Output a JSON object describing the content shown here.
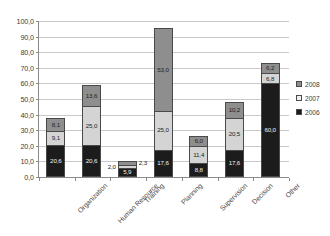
{
  "chart_data": {
    "type": "bar",
    "stacked": true,
    "title": "",
    "subtitle": "",
    "xlabel": "",
    "ylabel": "",
    "ylim": [
      0,
      100
    ],
    "ytick_step": 10,
    "grid": true,
    "legend_position": "right",
    "categories": [
      "Organization",
      "Human Resource",
      "Training",
      "Planning",
      "Supervision",
      "Decision",
      "Other"
    ],
    "ytick_labels": [
      "100,0",
      "90,0",
      "80,0",
      "70,0",
      "60,0",
      "50,0",
      "40,0",
      "30,0",
      "20,0",
      "10,0",
      "0,0"
    ],
    "ytick_values": [
      100,
      90,
      80,
      70,
      60,
      50,
      40,
      30,
      20,
      10,
      0
    ],
    "series": [
      {
        "name": "2006",
        "color": "#1c1c1c",
        "values": [
          20.6,
          20.6,
          5.9,
          17.6,
          8.8,
          17.6,
          60.0
        ],
        "labels": [
          "20,6",
          "20,6",
          "5,9",
          "17,6",
          "8,8",
          "17,6",
          "60,0"
        ]
      },
      {
        "name": "2007",
        "color": "#d4d4d4",
        "values": [
          9.1,
          25.0,
          2.0,
          25.0,
          11.4,
          20.5,
          6.8
        ],
        "labels": [
          "9,1",
          "25,0",
          "2,0",
          "25,0",
          "11,4",
          "20,5",
          "6,8"
        ]
      },
      {
        "name": "2008",
        "color": "#8e8e8e",
        "values": [
          8.1,
          13.6,
          2.3,
          53.0,
          6.0,
          10.2,
          6.2
        ],
        "labels": [
          "8,1",
          "13,6",
          "2,3",
          "53,0",
          "6,0",
          "10,2",
          "6,2"
        ]
      }
    ],
    "totals": [
      37.8,
      59.2,
      10.2,
      95.6,
      26.2,
      48.3,
      73.0
    ]
  },
  "legend": {
    "entries": [
      {
        "label": "2008",
        "swatch": "legend-swatch-2008"
      },
      {
        "label": "2007",
        "swatch": "legend-swatch-2007"
      },
      {
        "label": "2006",
        "swatch": "legend-swatch-2006"
      }
    ]
  }
}
